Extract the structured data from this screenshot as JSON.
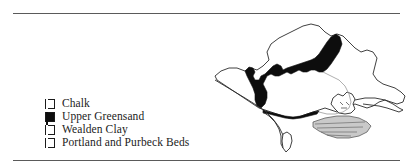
{
  "figure": {
    "type": "geological-map",
    "region": "Dorset and Wessex, southern England",
    "background": "#ffffff",
    "rule_color": "#5a5a5a"
  },
  "legend": {
    "items": [
      {
        "label": "Chalk",
        "fill": "#ffffff",
        "border": "#1a1a1a",
        "swatch_name": "legend-swatch-chalk"
      },
      {
        "label": "Upper Greensand",
        "fill": "#0d0d0d",
        "border": "#1a1a1a",
        "swatch_name": "legend-swatch-upper-greensand"
      },
      {
        "label": "Wealden Clay",
        "fill": "#9a9a9a",
        "border": "#1a1a1a",
        "swatch_name": "legend-swatch-wealden-clay"
      },
      {
        "label": "Portland and Purbeck Beds",
        "fill": "#dcdcdc",
        "border": "#1a1a1a",
        "swatch_name": "legend-swatch-portland-purbeck-beds"
      }
    ]
  },
  "map": {
    "outline_color": "#2b2b2b",
    "chalk_fill": "#ffffff",
    "greensand_fill": "#0d0d0d",
    "wealden_fill": "#efefef",
    "purbeck_fill": "#c9c9c9",
    "areas": [
      "main-outcrop-outline",
      "upper-greensand-band",
      "wealden-clay-basin",
      "portland-purbeck-beds",
      "isle-of-portland",
      "isle-of-purbeck",
      "coastline"
    ]
  }
}
